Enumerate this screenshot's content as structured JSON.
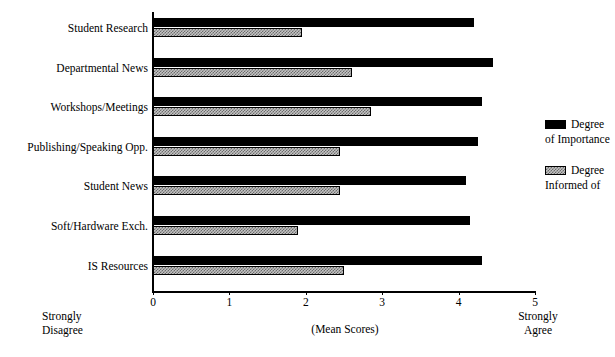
{
  "chart_data": {
    "type": "bar",
    "orientation": "horizontal",
    "title": "",
    "xlabel": "(Mean Scores)",
    "ylabel": "",
    "xlim": [
      0,
      5
    ],
    "grid": false,
    "legend_position": "right",
    "categories": [
      "Student Research",
      "Departmental News",
      "Workshops/Meetings",
      "Publishing/Speaking Opp.",
      "Student News",
      "Soft/Hardware Exch.",
      "IS Resources"
    ],
    "series": [
      {
        "name": "Degree of Importance",
        "color": "#000000",
        "values": [
          4.2,
          4.45,
          4.3,
          4.25,
          4.1,
          4.15,
          4.3
        ]
      },
      {
        "name": "Degree Informed of",
        "color": "#c3c3c3",
        "values": [
          1.95,
          2.6,
          2.85,
          2.45,
          2.45,
          1.9,
          2.5
        ]
      }
    ],
    "xticks": [
      0,
      1,
      2,
      3,
      4,
      5
    ],
    "xtick_labels": [
      "0",
      "1",
      "2",
      "3",
      "4",
      "5"
    ],
    "axis_captions": {
      "left_line1": "Strongly",
      "left_line2": "Disagree",
      "center": "(Mean Scores)",
      "right_line1": "Strongly",
      "right_line2": "Agree"
    },
    "legend": [
      {
        "line1": "Degree",
        "line2": "of Importance",
        "swatch": "black"
      },
      {
        "line1": "Degree",
        "line2": "Informed of",
        "swatch": "gray-hatch"
      }
    ]
  }
}
